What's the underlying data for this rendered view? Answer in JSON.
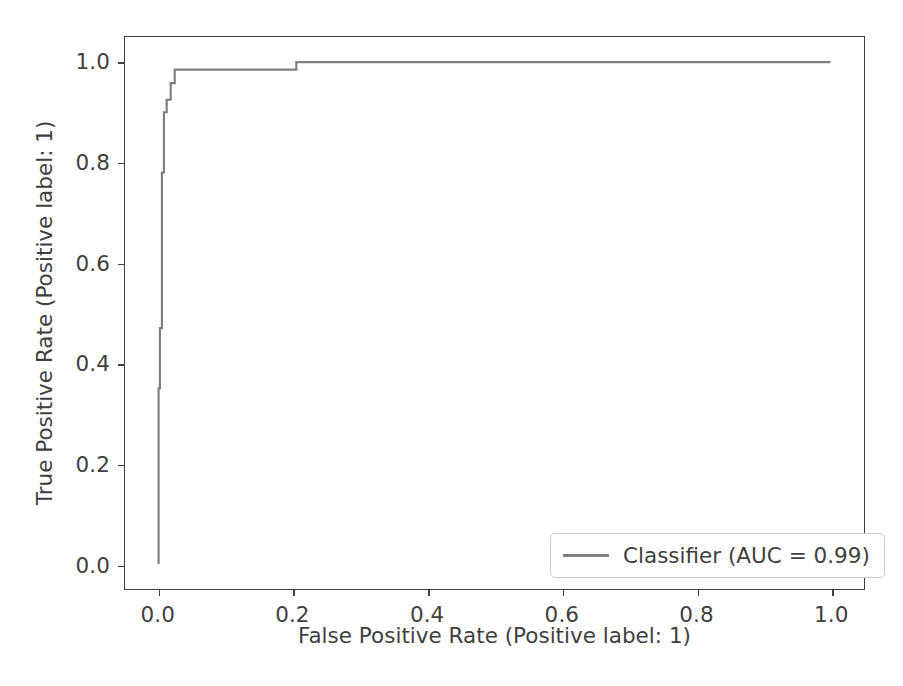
{
  "chart_data": {
    "type": "line",
    "title": "",
    "xlabel": "False Positive Rate (Positive label: 1)",
    "ylabel": "True Positive Rate (Positive label: 1)",
    "xlim": [
      -0.05,
      1.05
    ],
    "ylim": [
      -0.05,
      1.05
    ],
    "xticks": [
      "0.0",
      "0.2",
      "0.4",
      "0.6",
      "0.8",
      "1.0"
    ],
    "xtick_values": [
      0.0,
      0.2,
      0.4,
      0.6,
      0.8,
      1.0
    ],
    "yticks": [
      "0.0",
      "0.2",
      "0.4",
      "0.6",
      "0.8",
      "1.0"
    ],
    "ytick_values": [
      0.0,
      0.2,
      0.4,
      0.6,
      0.8,
      1.0
    ],
    "grid": false,
    "legend_position": "lower right",
    "line_color": "#808080",
    "axis_color": "#3f3f3f",
    "drawstyle": "steps-post",
    "series": [
      {
        "name": "Classifier (AUC = 0.99)",
        "auc": 0.99,
        "color": "#808080",
        "x": [
          0.0,
          0.0,
          0.002,
          0.002,
          0.005,
          0.005,
          0.008,
          0.008,
          0.012,
          0.012,
          0.018,
          0.018,
          0.024,
          0.024,
          0.032,
          0.032,
          0.205,
          0.205,
          1.0
        ],
        "y": [
          0.0,
          0.35,
          0.35,
          0.47,
          0.47,
          0.78,
          0.78,
          0.9,
          0.9,
          0.925,
          0.925,
          0.958,
          0.958,
          0.985,
          0.985,
          0.985,
          0.985,
          1.0,
          1.0
        ]
      }
    ]
  },
  "legend": {
    "entries": [
      {
        "label": "Classifier (AUC = 0.99)"
      }
    ]
  }
}
